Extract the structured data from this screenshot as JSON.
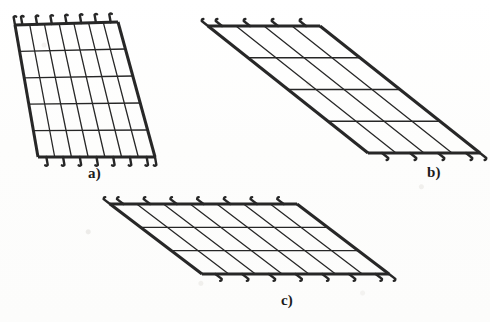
{
  "document": {
    "kind": "technical-line-drawing",
    "subject": "Welded wire reinforcement mesh panels with hooked edge bars",
    "background_color": "#fefefe",
    "ink_color": "#272727",
    "width": 490,
    "height": 322
  },
  "figures": [
    {
      "id": "a",
      "label": "a)",
      "label_x": 88,
      "label_y": 166,
      "description": "Steeply inclined parallelogram mesh panel, hooks along top and bottom edges",
      "corners": {
        "top_left": [
          15,
          25
        ],
        "top_right": [
          118,
          22
        ],
        "bottom_right": [
          155,
          157
        ],
        "bottom_left": [
          38,
          157
        ]
      },
      "columns": 7,
      "rows": 5,
      "hooks": {
        "top": 7,
        "bottom": 7,
        "direction_top": "up",
        "direction_bottom": "down"
      },
      "border_width": 3.0,
      "inner_width": 1.3
    },
    {
      "id": "b",
      "label": "b)",
      "label_x": 427,
      "label_y": 165,
      "description": "Strongly skewed parallelogram mesh panel, short top-left and bottom-right edges carrying hooks",
      "corners": {
        "top_left": [
          208,
          26
        ],
        "top_right": [
          320,
          26
        ],
        "bottom_right": [
          480,
          153
        ],
        "bottom_left": [
          368,
          153
        ]
      },
      "columns": 4,
      "rows": 4,
      "hooks": {
        "top": 4,
        "bottom": 4,
        "direction_top": "up",
        "direction_bottom": "down"
      },
      "border_width": 3.0,
      "inner_width": 1.3
    },
    {
      "id": "c",
      "label": "c)",
      "label_x": 281,
      "label_y": 293,
      "description": "Shallow wide parallelogram mesh panel, hooks along top and bottom edges",
      "corners": {
        "top_left": [
          110,
          204
        ],
        "top_right": [
          297,
          204
        ],
        "bottom_right": [
          389,
          274
        ],
        "bottom_left": [
          202,
          274
        ]
      },
      "columns": 7,
      "rows": 3,
      "hooks": {
        "top": 7,
        "bottom": 7,
        "direction_top": "up",
        "direction_bottom": "down"
      },
      "border_width": 3.0,
      "inner_width": 1.3
    }
  ],
  "labels": {
    "a": "a)",
    "b": "b)",
    "c": "c)"
  }
}
